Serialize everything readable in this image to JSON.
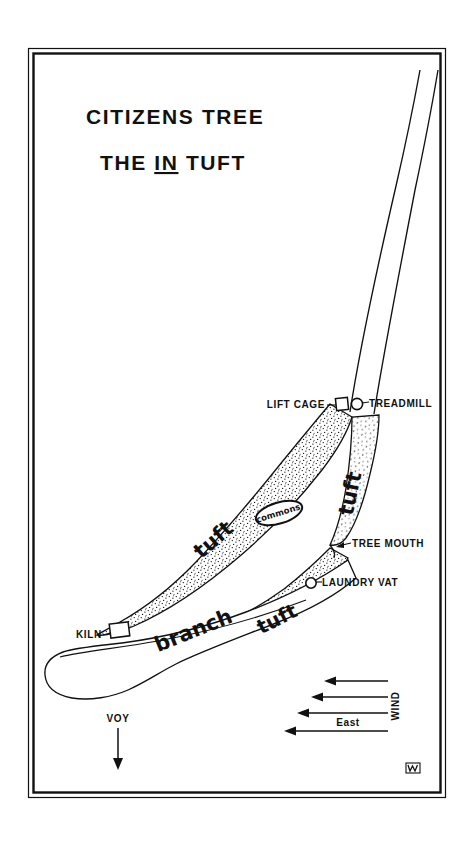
{
  "page": {
    "background": "#ffffff",
    "ink": "#111111",
    "frame": {
      "x": 28,
      "y": 48,
      "width": 418,
      "height": 750
    }
  },
  "title": {
    "line1": "CITIZENS TREE",
    "line2_pre": "THE ",
    "line2_underlined": "IN",
    "line2_post": " TUFT"
  },
  "labels": {
    "lift_cage": "LIFT CAGE",
    "treadmill": "TREADMILL",
    "tree_mouth": "TREE MOUTH",
    "laundry_vat": "LAUNDRY VAT",
    "kiln": "KILN",
    "commons": "commons",
    "branch": "branch",
    "tuft_upper": "tuft",
    "tuft_right": "tuft",
    "tuft_lower": "tuft",
    "voy": "VOY"
  },
  "compass": {
    "wind": "WIND",
    "east": "East",
    "arrow_count": 4
  },
  "signature": {
    "mark": "monogram"
  }
}
